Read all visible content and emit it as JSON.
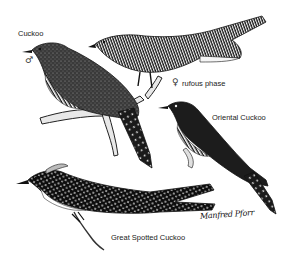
{
  "plate": {
    "background": "#ffffff",
    "ink_color": "#111111",
    "birds": [
      {
        "id": "cuckoo-male",
        "label": "Cuckoo",
        "sex_symbol": "♂"
      },
      {
        "id": "cuckoo-female-rufous",
        "label": "rufous phase",
        "sex_symbol": "♀"
      },
      {
        "id": "oriental-cuckoo",
        "label": "Oriental Cuckoo"
      },
      {
        "id": "great-spotted-cuckoo",
        "label": "Great Spotted Cuckoo"
      }
    ],
    "signature": "Manfred Pforr"
  }
}
